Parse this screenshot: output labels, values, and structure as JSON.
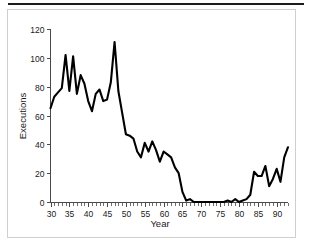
{
  "figure": {
    "top_rule": "horizontal-rule",
    "frame": "plot-border"
  },
  "chart_data": {
    "type": "line",
    "title": "",
    "xlabel": "Year",
    "ylabel": "Executions",
    "xlim": [
      30,
      93
    ],
    "ylim": [
      0,
      120
    ],
    "grid": false,
    "legend": "none",
    "line_color": "#000000",
    "x_major_ticks": [
      30,
      35,
      40,
      45,
      50,
      55,
      60,
      65,
      70,
      75,
      80,
      85,
      90
    ],
    "x_major_tick_labels": [
      "30",
      "35",
      "40",
      "45",
      "50",
      "55",
      "60",
      "65",
      "70",
      "75",
      "80",
      "85",
      "90"
    ],
    "x_minor_tick_step": 1,
    "y_major_ticks": [
      0,
      20,
      40,
      60,
      80,
      100,
      120
    ],
    "y_major_tick_labels": [
      "0",
      "20",
      "40",
      "60",
      "80",
      "100",
      "120"
    ],
    "x": [
      30,
      31,
      32,
      33,
      34,
      35,
      36,
      37,
      38,
      39,
      40,
      41,
      42,
      43,
      44,
      45,
      46,
      47,
      48,
      49,
      50,
      51,
      52,
      53,
      54,
      55,
      56,
      57,
      58,
      59,
      60,
      61,
      62,
      63,
      64,
      65,
      66,
      67,
      68,
      69,
      70,
      71,
      72,
      73,
      74,
      75,
      76,
      77,
      78,
      79,
      80,
      81,
      82,
      83,
      84,
      85,
      86,
      87,
      88,
      89,
      90,
      91,
      92,
      93
    ],
    "values": [
      65,
      73,
      76,
      79,
      102,
      77,
      101,
      75,
      88,
      82,
      70,
      63,
      75,
      78,
      70,
      71,
      83,
      111,
      77,
      62,
      47,
      46,
      44,
      35,
      31,
      41,
      35,
      42,
      36,
      28,
      35,
      33,
      31,
      24,
      20,
      7,
      1,
      2,
      0,
      0,
      0,
      0,
      0,
      0,
      0,
      0,
      0,
      1,
      0,
      2,
      0,
      1,
      2,
      5,
      21,
      18,
      18,
      25,
      11,
      16,
      23,
      14,
      31,
      38
    ],
    "series": [
      {
        "name": "Executions",
        "values": [
          65,
          73,
          76,
          79,
          102,
          77,
          101,
          75,
          88,
          82,
          70,
          63,
          75,
          78,
          70,
          71,
          83,
          111,
          77,
          62,
          47,
          46,
          44,
          35,
          31,
          41,
          35,
          42,
          36,
          28,
          35,
          33,
          31,
          24,
          20,
          7,
          1,
          2,
          0,
          0,
          0,
          0,
          0,
          0,
          0,
          0,
          0,
          1,
          0,
          2,
          0,
          1,
          2,
          5,
          21,
          18,
          18,
          25,
          11,
          16,
          23,
          14,
          31,
          38
        ]
      }
    ]
  }
}
